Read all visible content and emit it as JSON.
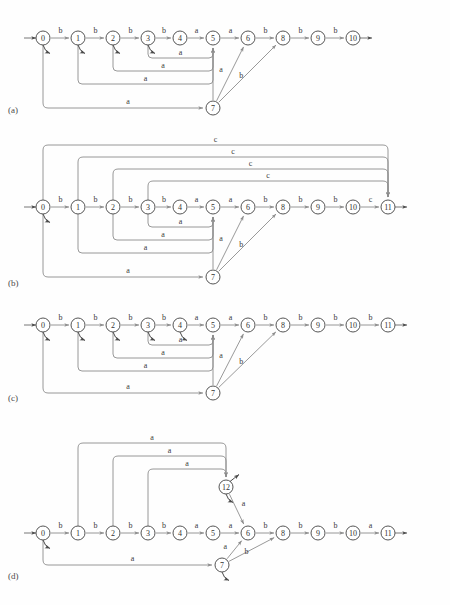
{
  "figure": {
    "background": "#fefefe",
    "node_fill": "#ffffff",
    "node_stroke": "#555555",
    "edge_color": "#8d8d8d",
    "label_color": "#3a3a3a"
  },
  "panels": [
    {
      "id": "a",
      "label": "(a)",
      "label_x": 8,
      "label_y": 112,
      "top": 0,
      "height": 130,
      "baseline_y": 38,
      "start_arrow": {
        "from_x": 24,
        "to_x": 36,
        "y": 38
      },
      "end_arrow": {
        "from_x": 360,
        "to_x": 372,
        "y": 38
      },
      "nodes": [
        {
          "id": "0",
          "label": "0",
          "x": 43,
          "y": 38,
          "r": 7,
          "stub": true
        },
        {
          "id": "1",
          "label": "1",
          "x": 78,
          "y": 38,
          "r": 7,
          "stub": true
        },
        {
          "id": "2",
          "label": "2",
          "x": 113,
          "y": 38,
          "r": 7,
          "stub": true
        },
        {
          "id": "3",
          "label": "3",
          "x": 148,
          "y": 38,
          "r": 7,
          "stub": true
        },
        {
          "id": "4",
          "label": "4",
          "x": 180,
          "y": 38,
          "r": 7,
          "stub": false
        },
        {
          "id": "5",
          "label": "5",
          "x": 213,
          "y": 38,
          "r": 7,
          "stub": false
        },
        {
          "id": "6",
          "label": "6",
          "x": 248,
          "y": 38,
          "r": 7,
          "stub": false
        },
        {
          "id": "8",
          "label": "8",
          "x": 283,
          "y": 38,
          "r": 7,
          "stub": false
        },
        {
          "id": "9",
          "label": "9",
          "x": 318,
          "y": 38,
          "r": 7,
          "stub": false
        },
        {
          "id": "10",
          "label": "10",
          "x": 353,
          "y": 38,
          "r": 7,
          "stub": false
        },
        {
          "id": "7",
          "label": "7",
          "x": 213,
          "y": 108,
          "r": 7,
          "stub": false
        }
      ],
      "linear_edges": [
        {
          "from": "0",
          "to": "1",
          "label": "b"
        },
        {
          "from": "1",
          "to": "2",
          "label": "b"
        },
        {
          "from": "2",
          "to": "3",
          "label": "b"
        },
        {
          "from": "3",
          "to": "4",
          "label": "b"
        },
        {
          "from": "4",
          "to": "5",
          "label": "a"
        },
        {
          "from": "5",
          "to": "6",
          "label": "a"
        },
        {
          "from": "6",
          "to": "8",
          "label": "b"
        },
        {
          "from": "8",
          "to": "9",
          "label": "b"
        },
        {
          "from": "9",
          "to": "10",
          "label": "b"
        }
      ],
      "back_edges": [
        {
          "from": "3",
          "to": "5",
          "label": "a",
          "depth": 20,
          "label_dx": 0
        },
        {
          "from": "2",
          "to": "5",
          "label": "a",
          "depth": 33,
          "label_dx": 0
        },
        {
          "from": "1",
          "to": "5",
          "label": "a",
          "depth": 46,
          "label_dx": 0
        }
      ],
      "bottom_edges": [
        {
          "from": "0",
          "to": "7",
          "label": "a",
          "depth": 70
        }
      ],
      "fan_edges": [
        {
          "from": "7",
          "to": "5",
          "label": "",
          "label_dx": 0,
          "label_dy": 0
        },
        {
          "from": "7",
          "to": "6",
          "label": "a",
          "label_dx": -9,
          "label_dy": -2
        },
        {
          "from": "7",
          "to": "8",
          "label": "b",
          "label_dx": -6,
          "label_dy": 4
        }
      ],
      "top_edges": []
    },
    {
      "id": "b",
      "label": "(b)",
      "label_x": 8,
      "label_y": 285,
      "top": 0,
      "height": 165,
      "baseline_y": 207,
      "start_arrow": {
        "from_x": 24,
        "to_x": 36,
        "y": 207
      },
      "end_arrow": {
        "from_x": 395,
        "to_x": 407,
        "y": 207
      },
      "nodes": [
        {
          "id": "0",
          "label": "0",
          "x": 43,
          "y": 207,
          "r": 7,
          "stub": true
        },
        {
          "id": "1",
          "label": "1",
          "x": 78,
          "y": 207,
          "r": 7,
          "stub": false
        },
        {
          "id": "2",
          "label": "2",
          "x": 113,
          "y": 207,
          "r": 7,
          "stub": false
        },
        {
          "id": "3",
          "label": "3",
          "x": 148,
          "y": 207,
          "r": 7,
          "stub": false
        },
        {
          "id": "4",
          "label": "4",
          "x": 180,
          "y": 207,
          "r": 7,
          "stub": false
        },
        {
          "id": "5",
          "label": "5",
          "x": 213,
          "y": 207,
          "r": 7,
          "stub": false
        },
        {
          "id": "6",
          "label": "6",
          "x": 248,
          "y": 207,
          "r": 7,
          "stub": false
        },
        {
          "id": "8",
          "label": "8",
          "x": 283,
          "y": 207,
          "r": 7,
          "stub": false
        },
        {
          "id": "9",
          "label": "9",
          "x": 318,
          "y": 207,
          "r": 7,
          "stub": false
        },
        {
          "id": "10",
          "label": "10",
          "x": 353,
          "y": 207,
          "r": 7,
          "stub": false
        },
        {
          "id": "11",
          "label": "11",
          "x": 388,
          "y": 207,
          "r": 7,
          "stub": false
        },
        {
          "id": "7",
          "label": "7",
          "x": 213,
          "y": 277,
          "r": 7,
          "stub": false
        }
      ],
      "linear_edges": [
        {
          "from": "0",
          "to": "1",
          "label": "b"
        },
        {
          "from": "1",
          "to": "2",
          "label": "b"
        },
        {
          "from": "2",
          "to": "3",
          "label": "b"
        },
        {
          "from": "3",
          "to": "4",
          "label": "b"
        },
        {
          "from": "4",
          "to": "5",
          "label": "a"
        },
        {
          "from": "5",
          "to": "6",
          "label": "a"
        },
        {
          "from": "6",
          "to": "8",
          "label": "b"
        },
        {
          "from": "8",
          "to": "9",
          "label": "b"
        },
        {
          "from": "9",
          "to": "10",
          "label": "b"
        },
        {
          "from": "10",
          "to": "11",
          "label": "c"
        }
      ],
      "back_edges": [
        {
          "from": "3",
          "to": "5",
          "label": "a",
          "depth": 20,
          "label_dx": 0
        },
        {
          "from": "2",
          "to": "5",
          "label": "a",
          "depth": 33,
          "label_dx": 0
        },
        {
          "from": "1",
          "to": "5",
          "label": "a",
          "depth": 46,
          "label_dx": 0
        }
      ],
      "bottom_edges": [
        {
          "from": "0",
          "to": "7",
          "label": "a",
          "depth": 70
        }
      ],
      "fan_edges": [
        {
          "from": "7",
          "to": "5",
          "label": "",
          "label_dx": 0,
          "label_dy": 0
        },
        {
          "from": "7",
          "to": "6",
          "label": "a",
          "label_dx": -9,
          "label_dy": -2
        },
        {
          "from": "7",
          "to": "8",
          "label": "b",
          "label_dx": -6,
          "label_dy": 4
        }
      ],
      "top_edges": [
        {
          "from": "0",
          "to": "11",
          "label": "c",
          "height": 62
        },
        {
          "from": "1",
          "to": "11",
          "label": "c",
          "height": 50
        },
        {
          "from": "2",
          "to": "11",
          "label": "c",
          "height": 38
        },
        {
          "from": "3",
          "to": "11",
          "label": "c",
          "height": 26
        }
      ]
    },
    {
      "id": "c",
      "label": "(c)",
      "label_x": 8,
      "label_y": 400,
      "top": 0,
      "height": 125,
      "baseline_y": 325,
      "start_arrow": {
        "from_x": 24,
        "to_x": 36,
        "y": 325
      },
      "end_arrow": {
        "from_x": 395,
        "to_x": 407,
        "y": 325
      },
      "nodes": [
        {
          "id": "0",
          "label": "0",
          "x": 43,
          "y": 325,
          "r": 7,
          "stub": true
        },
        {
          "id": "1",
          "label": "1",
          "x": 78,
          "y": 325,
          "r": 7,
          "stub": true
        },
        {
          "id": "2",
          "label": "2",
          "x": 113,
          "y": 325,
          "r": 7,
          "stub": true
        },
        {
          "id": "3",
          "label": "3",
          "x": 148,
          "y": 325,
          "r": 7,
          "stub": true
        },
        {
          "id": "4",
          "label": "4",
          "x": 180,
          "y": 325,
          "r": 7,
          "stub": true
        },
        {
          "id": "5",
          "label": "5",
          "x": 213,
          "y": 325,
          "r": 7,
          "stub": false
        },
        {
          "id": "6",
          "label": "6",
          "x": 248,
          "y": 325,
          "r": 7,
          "stub": false
        },
        {
          "id": "8",
          "label": "8",
          "x": 283,
          "y": 325,
          "r": 7,
          "stub": false
        },
        {
          "id": "9",
          "label": "9",
          "x": 318,
          "y": 325,
          "r": 7,
          "stub": false
        },
        {
          "id": "10",
          "label": "10",
          "x": 353,
          "y": 325,
          "r": 7,
          "stub": false
        },
        {
          "id": "11",
          "label": "11",
          "x": 388,
          "y": 325,
          "r": 7,
          "stub": false
        },
        {
          "id": "7",
          "label": "7",
          "x": 213,
          "y": 393,
          "r": 7,
          "stub": false
        }
      ],
      "linear_edges": [
        {
          "from": "0",
          "to": "1",
          "label": "b"
        },
        {
          "from": "1",
          "to": "2",
          "label": "b"
        },
        {
          "from": "2",
          "to": "3",
          "label": "b"
        },
        {
          "from": "3",
          "to": "4",
          "label": "b"
        },
        {
          "from": "4",
          "to": "5",
          "label": "a"
        },
        {
          "from": "5",
          "to": "6",
          "label": "a"
        },
        {
          "from": "6",
          "to": "8",
          "label": "b"
        },
        {
          "from": "8",
          "to": "9",
          "label": "b"
        },
        {
          "from": "9",
          "to": "10",
          "label": "b"
        },
        {
          "from": "10",
          "to": "11",
          "label": "b"
        }
      ],
      "back_edges": [
        {
          "from": "3",
          "to": "5",
          "label": "a",
          "depth": 20,
          "label_dx": 0
        },
        {
          "from": "2",
          "to": "5",
          "label": "a",
          "depth": 33,
          "label_dx": 0
        },
        {
          "from": "1",
          "to": "5",
          "label": "a",
          "depth": 46,
          "label_dx": 0
        }
      ],
      "bottom_edges": [
        {
          "from": "0",
          "to": "7",
          "label": "a",
          "depth": 68
        }
      ],
      "fan_edges": [
        {
          "from": "7",
          "to": "5",
          "label": "",
          "label_dx": 0,
          "label_dy": 0
        },
        {
          "from": "7",
          "to": "6",
          "label": "a",
          "label_dx": -9,
          "label_dy": -2
        },
        {
          "from": "7",
          "to": "8",
          "label": "b",
          "label_dx": -6,
          "label_dy": 4
        }
      ],
      "top_edges": []
    },
    {
      "id": "d",
      "label": "(d)",
      "label_x": 8,
      "label_y": 578,
      "top": 0,
      "height": 180,
      "baseline_y": 533,
      "start_arrow": {
        "from_x": 24,
        "to_x": 36,
        "y": 533
      },
      "end_arrow": {
        "from_x": 395,
        "to_x": 407,
        "y": 533
      },
      "nodes": [
        {
          "id": "0",
          "label": "0",
          "x": 43,
          "y": 533,
          "r": 7,
          "stub": true
        },
        {
          "id": "1",
          "label": "1",
          "x": 78,
          "y": 533,
          "r": 7,
          "stub": false
        },
        {
          "id": "2",
          "label": "2",
          "x": 113,
          "y": 533,
          "r": 7,
          "stub": false
        },
        {
          "id": "3",
          "label": "3",
          "x": 148,
          "y": 533,
          "r": 7,
          "stub": false
        },
        {
          "id": "4",
          "label": "4",
          "x": 180,
          "y": 533,
          "r": 7,
          "stub": false
        },
        {
          "id": "5",
          "label": "5",
          "x": 213,
          "y": 533,
          "r": 7,
          "stub": false
        },
        {
          "id": "6",
          "label": "6",
          "x": 248,
          "y": 533,
          "r": 7,
          "stub": false
        },
        {
          "id": "8",
          "label": "8",
          "x": 283,
          "y": 533,
          "r": 7,
          "stub": false
        },
        {
          "id": "9",
          "label": "9",
          "x": 318,
          "y": 533,
          "r": 7,
          "stub": false
        },
        {
          "id": "10",
          "label": "10",
          "x": 353,
          "y": 533,
          "r": 7,
          "stub": false
        },
        {
          "id": "11",
          "label": "11",
          "x": 388,
          "y": 533,
          "r": 7,
          "stub": false
        },
        {
          "id": "7",
          "label": "7",
          "x": 222,
          "y": 565,
          "r": 7,
          "stub": true
        },
        {
          "id": "12",
          "label": "12",
          "x": 226,
          "y": 487,
          "r": 7,
          "stub": true
        }
      ],
      "linear_edges": [
        {
          "from": "0",
          "to": "1",
          "label": "b"
        },
        {
          "from": "1",
          "to": "2",
          "label": "b"
        },
        {
          "from": "2",
          "to": "3",
          "label": "b"
        },
        {
          "from": "3",
          "to": "4",
          "label": "b"
        },
        {
          "from": "4",
          "to": "5",
          "label": "a"
        },
        {
          "from": "5",
          "to": "6",
          "label": "a"
        },
        {
          "from": "6",
          "to": "8",
          "label": "b"
        },
        {
          "from": "8",
          "to": "9",
          "label": "b"
        },
        {
          "from": "9",
          "to": "10",
          "label": "b"
        },
        {
          "from": "10",
          "to": "11",
          "label": "a"
        }
      ],
      "back_edges": [],
      "bottom_edges": [
        {
          "from": "0",
          "to": "7",
          "label": "a",
          "depth": 32
        }
      ],
      "fan_edges": [
        {
          "from": "7",
          "to": "6",
          "label": "a",
          "label_dx": -9,
          "label_dy": -1
        },
        {
          "from": "7",
          "to": "8",
          "label": "b",
          "label_dx": -5,
          "label_dy": 5
        },
        {
          "from": "12",
          "to": "6",
          "label": "a",
          "label_dx": 7,
          "label_dy": -3
        }
      ],
      "up_edges": [
        {
          "from": "1",
          "to": "12",
          "label": "a",
          "height": 90
        },
        {
          "from": "2",
          "to": "12",
          "label": "a",
          "height": 77
        },
        {
          "from": "3",
          "to": "12",
          "label": "a",
          "height": 64
        }
      ],
      "top_edges": []
    }
  ]
}
